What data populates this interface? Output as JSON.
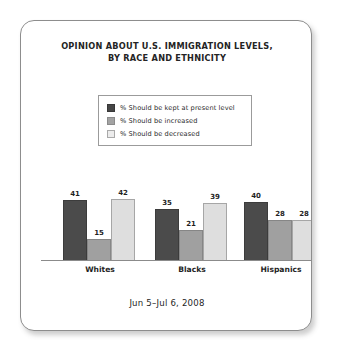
{
  "card": {
    "border_color": "#8d8d8d",
    "background": "#ffffff"
  },
  "title": {
    "line1": "OPINION ABOUT U.S. IMMIGRATION LEVELS,",
    "line2": "BY RACE AND ETHNICITY"
  },
  "legend": {
    "items": [
      {
        "label": "% Should be kept at present level",
        "color": "#4b4b4b",
        "swatch": "dark-swatch"
      },
      {
        "label": "% Should be increased",
        "color": "#a0a0a0",
        "swatch": "mid-gray-swatch"
      },
      {
        "label": "% Should be decreased",
        "color": "#dedede",
        "swatch": "light-gray-swatch"
      }
    ]
  },
  "footer": {
    "date_range": "Jun 5–Jul 6, 2008"
  },
  "chart_data": {
    "type": "bar",
    "title": "OPINION ABOUT U.S. IMMIGRATION LEVELS, BY RACE AND ETHNICITY",
    "subtitle": "Jun 5–Jul 6, 2008",
    "xlabel": "",
    "ylabel": "",
    "ylim": [
      0,
      50
    ],
    "grid": false,
    "legend_position": "top-center",
    "categories": [
      "Whites",
      "Blacks",
      "Hispanics"
    ],
    "series": [
      {
        "name": "% Should be kept at present level",
        "color": "#4b4b4b",
        "values": [
          41,
          35,
          40
        ],
        "labels": [
          "41",
          "35",
          "40"
        ]
      },
      {
        "name": "% Should be increased",
        "color": "#a0a0a0",
        "values": [
          15,
          21,
          28
        ],
        "labels": [
          "15",
          "21",
          "28"
        ]
      },
      {
        "name": "% Should be decreased",
        "color": "#dedede",
        "values": [
          42,
          39,
          28
        ],
        "labels": [
          "42",
          "39",
          "28"
        ]
      }
    ]
  }
}
